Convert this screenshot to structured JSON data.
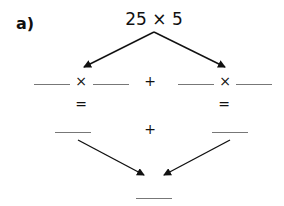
{
  "part_label": "a)",
  "expression": "25 × 5",
  "row1": {
    "left_op": "×",
    "middle_op": "+",
    "right_op": "×"
  },
  "row2": {
    "left_eq": "=",
    "right_eq": "="
  },
  "row3": {
    "middle_op": "+"
  },
  "colors": {
    "ink": "#111111",
    "blank_line": "#777777"
  }
}
